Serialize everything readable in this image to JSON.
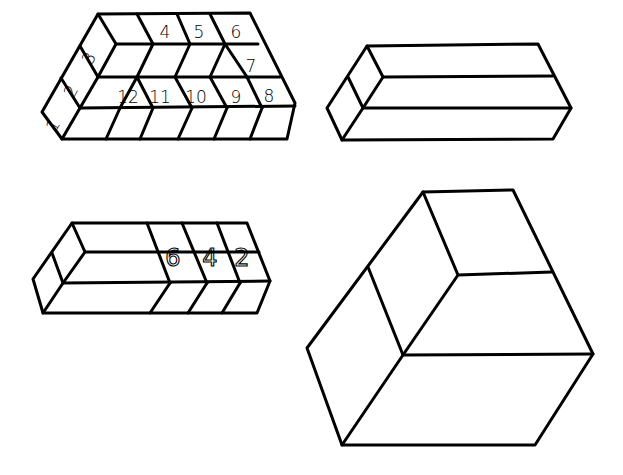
{
  "figures": [
    {
      "id": "figure-1",
      "description": "Block made of numbered cubes with a slanted left column",
      "labels": [
        {
          "text": "1",
          "x": 58,
          "y": 128,
          "rotate": -60
        },
        {
          "text": "2",
          "x": 76,
          "y": 94,
          "rotate": -60
        },
        {
          "text": "3",
          "x": 94,
          "y": 61,
          "rotate": -60
        },
        {
          "text": "4",
          "x": 165,
          "y": 38,
          "rotate": 0
        },
        {
          "text": "5",
          "x": 199,
          "y": 38,
          "rotate": 0
        },
        {
          "text": "6",
          "x": 236,
          "y": 38,
          "rotate": 0
        },
        {
          "text": "7",
          "x": 251,
          "y": 72,
          "rotate": 0
        },
        {
          "text": "8",
          "x": 269,
          "y": 102,
          "rotate": 0
        },
        {
          "text": "9",
          "x": 236,
          "y": 103,
          "rotate": 0
        },
        {
          "text": "10",
          "x": 196,
          "y": 103,
          "rotate": 0
        },
        {
          "text": "11",
          "x": 160,
          "y": 103,
          "rotate": 0
        },
        {
          "text": "12",
          "x": 128,
          "y": 103,
          "rotate": 0
        }
      ]
    },
    {
      "id": "figure-2",
      "description": "Long rectangular block with two horizontal layers and split end face",
      "labels": []
    },
    {
      "id": "figure-3",
      "description": "Long block with three numbered segments",
      "labels": [
        {
          "text": "6",
          "x": 173,
          "y": 266,
          "rotate": 0
        },
        {
          "text": "4",
          "x": 210,
          "y": 266,
          "rotate": 0
        },
        {
          "text": "2",
          "x": 242,
          "y": 266,
          "rotate": 0
        }
      ]
    },
    {
      "id": "figure-4",
      "description": "Large cube-like block divided into faces",
      "labels": []
    }
  ]
}
